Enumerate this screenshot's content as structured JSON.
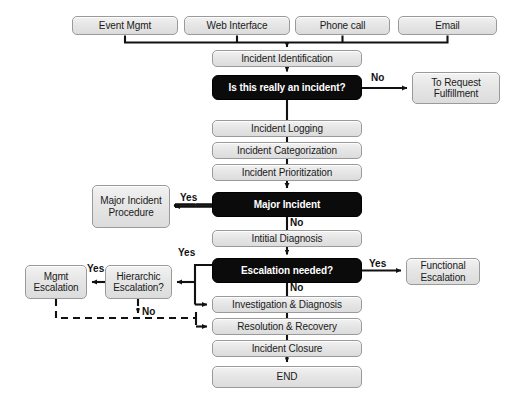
{
  "diagram": {
    "colors": {
      "process_fill": "#e6e6e6",
      "process_border": "#9a9a9a",
      "decision_fill": "#0b0b0b",
      "decision_text": "#ffffff",
      "line": "#111111",
      "background": "#ffffff"
    },
    "nodes": [
      {
        "id": "event_mgmt",
        "label": "Event Mgmt",
        "type": "process",
        "x": 72,
        "y": 16,
        "w": 106,
        "h": 19
      },
      {
        "id": "web_interface",
        "label": "Web Interface",
        "type": "process",
        "x": 184,
        "y": 16,
        "w": 106,
        "h": 19
      },
      {
        "id": "phone_call",
        "label": "Phone call",
        "type": "process",
        "x": 295,
        "y": 16,
        "w": 95,
        "h": 19
      },
      {
        "id": "email",
        "label": "Email",
        "type": "process",
        "x": 398,
        "y": 16,
        "w": 99,
        "h": 19
      },
      {
        "id": "incident_id",
        "label": "Incident Identification",
        "type": "process",
        "x": 212,
        "y": 50,
        "w": 150,
        "h": 17
      },
      {
        "id": "really_incident",
        "label": "Is this really an incident?",
        "type": "decision",
        "x": 212,
        "y": 75,
        "w": 150,
        "h": 25
      },
      {
        "id": "to_request",
        "label": "To Request Fulfillment",
        "type": "process",
        "x": 412,
        "y": 72,
        "w": 88,
        "h": 32
      },
      {
        "id": "incident_logging",
        "label": "Incident Logging",
        "type": "process",
        "x": 212,
        "y": 120,
        "w": 150,
        "h": 17
      },
      {
        "id": "incident_cat",
        "label": "Incident Categorization",
        "type": "process",
        "x": 212,
        "y": 142,
        "w": 150,
        "h": 17
      },
      {
        "id": "incident_prio",
        "label": "Incident Prioritization",
        "type": "process",
        "x": 212,
        "y": 164,
        "w": 150,
        "h": 17
      },
      {
        "id": "major_incident",
        "label": "Major Incident",
        "type": "decision",
        "x": 212,
        "y": 192,
        "w": 150,
        "h": 25
      },
      {
        "id": "major_procedure",
        "label": "Major Incident Procedure",
        "type": "process",
        "x": 92,
        "y": 185,
        "w": 78,
        "h": 43
      },
      {
        "id": "initial_diagnosis",
        "label": "Intitial Diagnosis",
        "type": "process",
        "x": 212,
        "y": 230,
        "w": 150,
        "h": 17
      },
      {
        "id": "escalation_needed",
        "label": "Escalation needed?",
        "type": "decision",
        "x": 212,
        "y": 258,
        "w": 150,
        "h": 25
      },
      {
        "id": "functional_esc",
        "label": "Functional Escalation",
        "type": "process",
        "x": 406,
        "y": 258,
        "w": 74,
        "h": 27
      },
      {
        "id": "hierarchic_esc",
        "label": "Hierarchic Escalation?",
        "type": "process",
        "x": 105,
        "y": 265,
        "w": 67,
        "h": 34
      },
      {
        "id": "mgmt_esc",
        "label": "Mgmt Escalation",
        "type": "process",
        "x": 25,
        "y": 265,
        "w": 62,
        "h": 34
      },
      {
        "id": "investigation",
        "label": "Investigation & Diagnosis",
        "type": "process",
        "x": 212,
        "y": 296,
        "w": 150,
        "h": 17
      },
      {
        "id": "resolution",
        "label": "Resolution & Recovery",
        "type": "process",
        "x": 212,
        "y": 318,
        "w": 150,
        "h": 17
      },
      {
        "id": "incident_closure",
        "label": "Incident Closure",
        "type": "process",
        "x": 212,
        "y": 340,
        "w": 150,
        "h": 17
      },
      {
        "id": "end",
        "label": "END",
        "type": "terminal",
        "x": 212,
        "y": 366,
        "w": 150,
        "h": 22
      }
    ],
    "edge_labels": [
      {
        "id": "no_not_incident",
        "text": "No",
        "x": 371,
        "y": 72
      },
      {
        "id": "yes_major",
        "text": "Yes",
        "x": 180,
        "y": 192
      },
      {
        "id": "no_major",
        "text": "No",
        "x": 290,
        "y": 218
      },
      {
        "id": "yes_escalation_l",
        "text": "Yes",
        "x": 180,
        "y": 248
      },
      {
        "id": "yes_escalation_r",
        "text": "Yes",
        "x": 370,
        "y": 258
      },
      {
        "id": "yes_hierarchic",
        "text": "Yes",
        "x": 88,
        "y": 263
      },
      {
        "id": "no_hierarchic",
        "text": "No",
        "x": 143,
        "y": 307
      },
      {
        "id": "no_escalation",
        "text": "No",
        "x": 290,
        "y": 283
      }
    ]
  }
}
